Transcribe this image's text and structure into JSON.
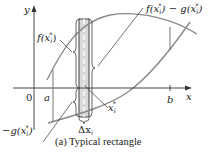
{
  "figure": {
    "caption": "(a)  Typical rectangle",
    "axes": {
      "x_label": "x",
      "y_label": "y",
      "origin_label": "0",
      "a_label": "a",
      "b_label": "b"
    },
    "labels": {
      "f_value": "f(x",
      "f_sub": "i",
      "f_sup": "*",
      "f_close": ")",
      "diff_f": "f(x",
      "diff_sub1": "i",
      "diff_sup1": "*",
      "diff_mid": ") − g(x",
      "diff_sub2": "i",
      "diff_sup2": "*",
      "diff_close": ")",
      "neg_g": "−g(x",
      "neg_g_sub": "i",
      "neg_g_sup": "*",
      "neg_g_close": ")",
      "xi_star": "x",
      "xi_sub": "i",
      "xi_sup": "*",
      "delta_x": "Δx",
      "delta_sub": "i"
    },
    "colors": {
      "curve": "#8a8a8a",
      "axis": "#333333",
      "rect_fill": "#d9d9d9",
      "rect_stroke": "#444444"
    }
  }
}
